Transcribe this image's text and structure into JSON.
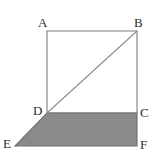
{
  "figure": {
    "background_color": "#ffffff",
    "stroke_color": "#7d7d7d",
    "diagonal_color": "#8c8c8c",
    "shade_fill_color": "#8a8a8a",
    "shade_stroke_color": "#6f6f6f",
    "label_color": "#2b2b2b",
    "stroke_width": 1.1
  },
  "vertices": [
    {
      "id": "A",
      "label": "A",
      "x": 47,
      "y": 31,
      "label_x": 38,
      "label_y": 16
    },
    {
      "id": "B",
      "label": "B",
      "x": 137,
      "y": 31,
      "label_x": 134,
      "label_y": 16
    },
    {
      "id": "C",
      "label": "C",
      "x": 137,
      "y": 113,
      "label_x": 140,
      "label_y": 106
    },
    {
      "id": "D",
      "label": "D",
      "x": 47,
      "y": 113,
      "label_x": 33,
      "label_y": 104
    },
    {
      "id": "E",
      "label": "E",
      "x": 15,
      "y": 146,
      "label_x": 3,
      "label_y": 137
    },
    {
      "id": "F",
      "label": "F",
      "x": 137,
      "y": 146,
      "label_x": 140,
      "label_y": 138
    }
  ],
  "shapes": {
    "square_points": "47,31 137,31 137,113 47,113",
    "shaded_parallelogram_points": "47,113 137,113 137,146 15,146",
    "diagonal": {
      "from": "D",
      "x1": 47,
      "y1": 113,
      "x2": 137,
      "y2": 31
    }
  },
  "edges": [
    {
      "name": "AB",
      "x1": 47,
      "y1": 31,
      "x2": 137,
      "y2": 31
    },
    {
      "name": "BC",
      "x1": 137,
      "y1": 31,
      "x2": 137,
      "y2": 113
    },
    {
      "name": "CD",
      "x1": 137,
      "y1": 113,
      "x2": 47,
      "y2": 113
    },
    {
      "name": "DA",
      "x1": 47,
      "y1": 113,
      "x2": 47,
      "y2": 31
    },
    {
      "name": "DB",
      "x1": 47,
      "y1": 113,
      "x2": 137,
      "y2": 31
    },
    {
      "name": "DE",
      "x1": 47,
      "y1": 113,
      "x2": 15,
      "y2": 146
    },
    {
      "name": "EF",
      "x1": 15,
      "y1": 146,
      "x2": 137,
      "y2": 146
    },
    {
      "name": "FC",
      "x1": 137,
      "y1": 146,
      "x2": 137,
      "y2": 113
    }
  ]
}
